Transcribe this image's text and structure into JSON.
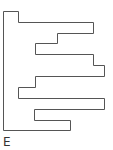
{
  "diagram": {
    "label": "E",
    "stroke_color": "#555555",
    "shape": "rectilinear polyline outline",
    "points": "3.5,11.5 18.5,11.5 18.5,22.5 93.5,22.5 93.5,33.5 57.5,33.5 57.5,43.5 35.5,43.5 35.5,54.5 93.5,54.5 93.5,65.5 104.5,65.5 104.5,76.5 35.5,76.5 35.5,87.5 18.5,87.5 18.5,98.5 104.5,98.5 104.5,109.5 34.5,109.5 34.5,120.5 70.5,120.5 70.5,130.5 3.5,130.5"
  }
}
